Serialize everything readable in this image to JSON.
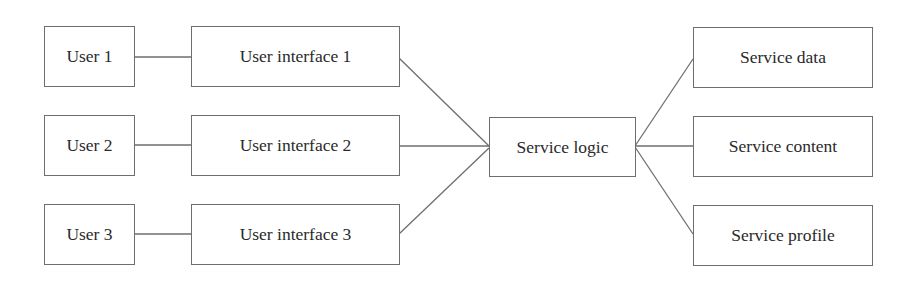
{
  "diagram": {
    "users": [
      {
        "label": "User 1"
      },
      {
        "label": "User 2"
      },
      {
        "label": "User 3"
      }
    ],
    "interfaces": [
      {
        "label": "User interface 1"
      },
      {
        "label": "User interface 2"
      },
      {
        "label": "User interface 3"
      }
    ],
    "logic": {
      "label": "Service logic"
    },
    "services": [
      {
        "label": "Service data"
      },
      {
        "label": "Service content"
      },
      {
        "label": "Service profile"
      }
    ],
    "colors": {
      "line": "#6e6e6e",
      "text": "#2a2a2a",
      "background": "#ffffff"
    }
  }
}
